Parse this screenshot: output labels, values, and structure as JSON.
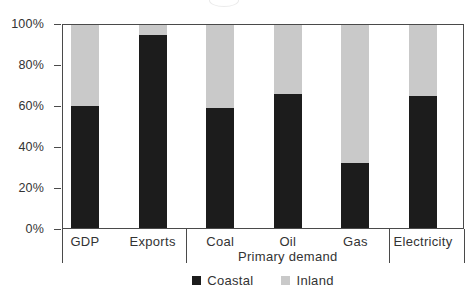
{
  "chart_data": {
    "type": "bar",
    "stacked": true,
    "percent_stacked": true,
    "title": "",
    "categories": [
      "GDP",
      "Exports",
      "Coal",
      "Oil",
      "Gas",
      "Electricity"
    ],
    "groups": [
      {
        "label": "",
        "count": 2
      },
      {
        "label": "Primary demand",
        "count": 3
      },
      {
        "label": "",
        "count": 1
      }
    ],
    "series": [
      {
        "name": "Coastal",
        "color": "#1c1c1c",
        "values": [
          60,
          95,
          59,
          66,
          32,
          65
        ]
      },
      {
        "name": "Inland",
        "color": "#c9c9c9",
        "values": [
          40,
          5,
          41,
          34,
          68,
          35
        ]
      }
    ],
    "xlabel": "",
    "ylabel": "",
    "ylim": [
      0,
      100
    ],
    "yticks": [
      0,
      20,
      40,
      60,
      80,
      100
    ],
    "ytick_labels": [
      "0%",
      "20%",
      "40%",
      "60%",
      "80%",
      "100%"
    ],
    "grid": false,
    "legend_position": "bottom"
  },
  "colors": {
    "background": "#ffffff",
    "axis": "#4a4a4a",
    "text": "#333333",
    "coastal": "#1c1c1c",
    "inland": "#c9c9c9"
  }
}
